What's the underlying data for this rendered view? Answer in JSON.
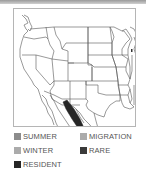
{
  "map": {
    "region": "Western and Central United States with northern Mexico",
    "range_highlight": {
      "type": "resident",
      "description": "Narrow diagonal band in northwestern Mexico (Sonora/Sinaloa)"
    }
  },
  "legend": {
    "items": [
      {
        "key": "summer",
        "label": "SUMMER",
        "color": "#8c8c8c"
      },
      {
        "key": "migration",
        "label": "MIGRATION",
        "color": "#ababab"
      },
      {
        "key": "winter",
        "label": "WINTER",
        "color": "#ababab"
      },
      {
        "key": "rare",
        "label": "RARE",
        "color": "#3a3a3a"
      },
      {
        "key": "resident",
        "label": "RESIDENT",
        "color": "#262626"
      }
    ]
  },
  "colors": {
    "border_lines": "#555555",
    "frame": "#b5b5b5",
    "resident_fill": "#262626"
  }
}
